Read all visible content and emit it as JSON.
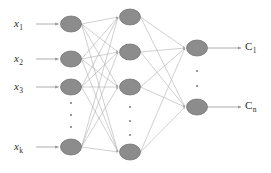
{
  "figure": {
    "type": "neural-network-diagram",
    "width": 271,
    "height": 173,
    "background": "#ffffff",
    "node_fill": "#8c8c8c",
    "node_stroke": "#6e6e6e",
    "edge_color": "#a8a8a8",
    "arrow_color": "#9a9a9a",
    "text_color": "#2b2b2b",
    "dot_color": "#9a9a9a"
  },
  "inputs": {
    "labels": [
      {
        "base": "x",
        "sub": "1"
      },
      {
        "base": "x",
        "sub": "2"
      },
      {
        "base": "x",
        "sub": "3"
      },
      {
        "base": "x",
        "sub": "k"
      }
    ],
    "ellipsis": "vertical-dots"
  },
  "outputs": {
    "labels": [
      {
        "base": "C",
        "sub": "1"
      },
      {
        "base": "C",
        "sub": "n"
      }
    ],
    "ellipsis": "vertical-dots"
  },
  "layers": [
    {
      "name": "input-layer",
      "node_count": 4,
      "nodes": [
        {
          "cx": 71,
          "cy": 24
        },
        {
          "cx": 71,
          "cy": 59
        },
        {
          "cx": 71,
          "cy": 87
        },
        {
          "cx": 71,
          "cy": 147
        }
      ],
      "dots": [
        {
          "cx": 71,
          "cy": 103
        },
        {
          "cx": 71,
          "cy": 115
        },
        {
          "cx": 71,
          "cy": 127
        }
      ]
    },
    {
      "name": "hidden-layer-1",
      "node_count": 4,
      "nodes": [
        {
          "cx": 130,
          "cy": 17
        },
        {
          "cx": 130,
          "cy": 52
        },
        {
          "cx": 130,
          "cy": 87
        },
        {
          "cx": 130,
          "cy": 152
        }
      ],
      "dots": [
        {
          "cx": 130,
          "cy": 107
        },
        {
          "cx": 130,
          "cy": 121
        },
        {
          "cx": 130,
          "cy": 135
        }
      ]
    },
    {
      "name": "output-layer",
      "node_count": 2,
      "nodes": [
        {
          "cx": 197,
          "cy": 48
        },
        {
          "cx": 197,
          "cy": 107
        }
      ],
      "dots": [
        {
          "cx": 197,
          "cy": 71
        },
        {
          "cx": 197,
          "cy": 86
        }
      ]
    }
  ],
  "node_shape": {
    "rx": 10.5,
    "ry": 8
  },
  "input_arrows": [
    {
      "x1": 36,
      "y": 24
    },
    {
      "x1": 36,
      "y": 59
    },
    {
      "x1": 36,
      "y": 87
    },
    {
      "x1": 36,
      "y": 147
    }
  ],
  "output_arrows": [
    {
      "y": 48
    },
    {
      "y": 107
    }
  ],
  "input_label_positions": [
    {
      "x": 14,
      "y": 18
    },
    {
      "x": 14,
      "y": 53
    },
    {
      "x": 14,
      "y": 81
    },
    {
      "x": 14,
      "y": 141
    }
  ],
  "output_label_positions": [
    {
      "x": 245,
      "y": 41
    },
    {
      "x": 245,
      "y": 100
    }
  ]
}
